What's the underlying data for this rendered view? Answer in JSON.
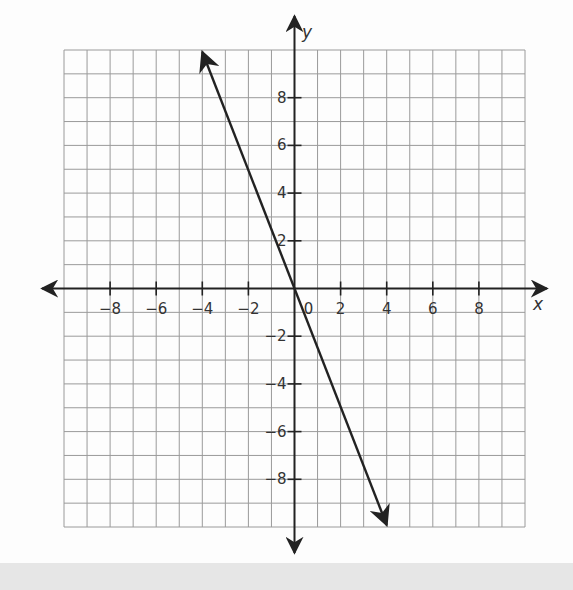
{
  "chart_data": {
    "type": "line",
    "title": "",
    "xlabel": "x",
    "ylabel": "y",
    "xlim": [
      -10,
      10
    ],
    "ylim": [
      -10,
      10
    ],
    "grid": true,
    "grid_step": 1,
    "x_ticks": [
      -8,
      -6,
      -4,
      -2,
      0,
      2,
      4,
      6,
      8
    ],
    "y_ticks": [
      -8,
      -6,
      -4,
      -2,
      2,
      4,
      6,
      8
    ],
    "x_tick_labels": [
      "−8",
      "−6",
      "−4",
      "−2",
      "0",
      "2",
      "4",
      "6",
      "8"
    ],
    "y_tick_labels": [
      "−8",
      "−6",
      "−4",
      "−2",
      "2",
      "4",
      "6",
      "8"
    ],
    "series": [
      {
        "name": "line",
        "equation": "y = -2.5x",
        "x": [
          -4,
          0,
          4
        ],
        "y": [
          10,
          0,
          -10
        ],
        "arrows": "both"
      }
    ],
    "colors": {
      "line": "#222222",
      "grid": "#9a9a9a",
      "axis": "#222222",
      "bottom_band": "#e6e6e6"
    }
  }
}
